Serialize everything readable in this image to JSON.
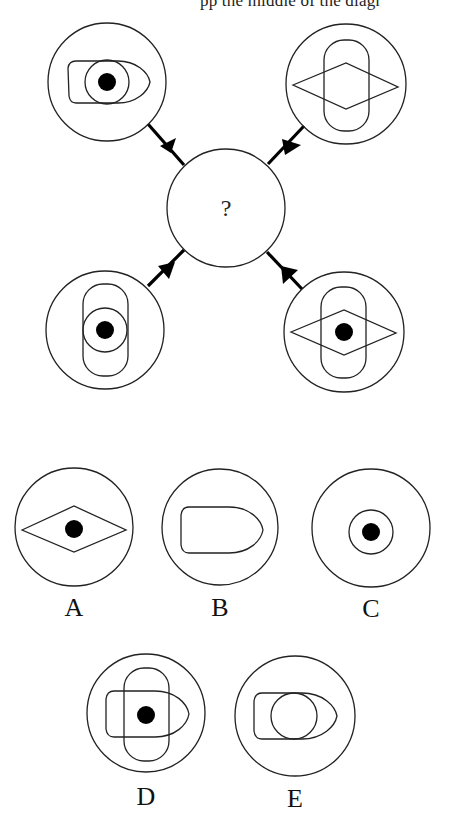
{
  "header": {
    "cropped_text": "pp                 the middle of the diagr"
  },
  "puzzle": {
    "center": {
      "label": "?",
      "description": "empty circle with question mark"
    },
    "inputs": [
      {
        "position": "top-left",
        "contents": [
          "bullet shape (horizontal, pointing right)",
          "small circle",
          "black dot"
        ]
      },
      {
        "position": "top-right",
        "contents": [
          "vertical stadium (rounded rectangle)",
          "diamond (horizontal rhombus)"
        ]
      },
      {
        "position": "bottom-left",
        "contents": [
          "vertical stadium (rounded rectangle)",
          "small circle",
          "black dot"
        ]
      },
      {
        "position": "bottom-right",
        "contents": [
          "vertical stadium (rounded rectangle)",
          "diamond (horizontal rhombus)",
          "black dot"
        ]
      }
    ],
    "connectors": "each outer circle is linked to the center circle by a thick line with a black triangular arrowhead pointing toward the center"
  },
  "options": [
    {
      "label": "A",
      "contents": [
        "diamond (horizontal rhombus)",
        "black dot"
      ]
    },
    {
      "label": "B",
      "contents": [
        "bullet shape (horizontal, pointing right)"
      ]
    },
    {
      "label": "C",
      "contents": [
        "small circle",
        "black dot"
      ]
    },
    {
      "label": "D",
      "contents": [
        "vertical stadium",
        "bullet shape",
        "black dot"
      ]
    },
    {
      "label": "E",
      "contents": [
        "bullet shape",
        "small circle"
      ]
    }
  ],
  "colors": {
    "stroke": "#222222",
    "fill_dot": "#000000",
    "background": "#ffffff"
  }
}
